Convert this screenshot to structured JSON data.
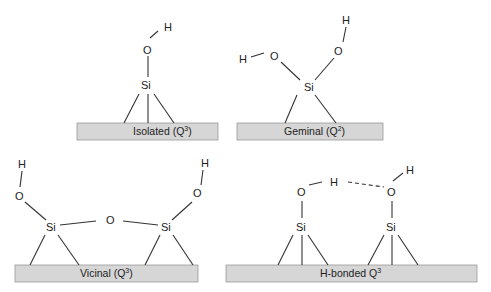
{
  "diagram": {
    "type": "chemical-structure-panels",
    "panels": [
      {
        "id": "isolated",
        "label": "Isolated (Q",
        "sup": "3",
        "label_suffix": ")",
        "atoms": {
          "si": "Si",
          "o": "O",
          "h": "H"
        }
      },
      {
        "id": "geminal",
        "label": "Geminal (Q",
        "sup": "2",
        "label_suffix": ")",
        "atoms": {
          "si": "Si",
          "o1": "O",
          "h1": "H",
          "o2": "O",
          "h2": "H"
        }
      },
      {
        "id": "vicinal",
        "label": "Vicinal (Q",
        "sup": "3",
        "label_suffix": ")",
        "atoms": {
          "si1": "Si",
          "o1": "O",
          "h1": "H",
          "bridge_o": "O",
          "si2": "Si",
          "o2": "O",
          "h2": "H"
        }
      },
      {
        "id": "h-bonded",
        "label": "H-bonded Q",
        "sup": "3",
        "label_suffix": "",
        "atoms": {
          "si1": "Si",
          "o1": "O",
          "h1": "H",
          "si2": "Si",
          "o2": "O",
          "h2": "H"
        }
      }
    ],
    "colors": {
      "surface_fill": "#d6d6d6",
      "surface_stroke": "#9a9a9a",
      "bond": "#333333",
      "text": "#222222"
    }
  }
}
